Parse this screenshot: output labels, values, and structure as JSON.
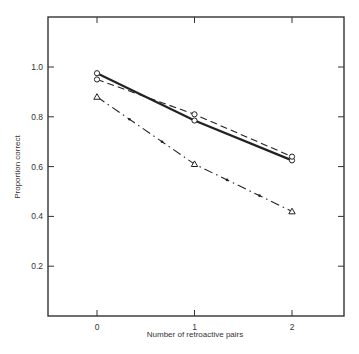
{
  "chart_data": {
    "type": "line",
    "title": "",
    "xlabel": "Number of retroactive pairs",
    "ylabel": "Proportion correct",
    "x": [
      0,
      1,
      2
    ],
    "xticks": [
      "0",
      "1",
      "2"
    ],
    "yticks": [
      "0.2",
      "0.4",
      "0.6",
      "0.8",
      "1.0"
    ],
    "xlim": [
      -0.5,
      2.5
    ],
    "ylim": [
      0,
      1.2
    ],
    "grid": false,
    "legend": null,
    "series": [
      {
        "name": "solid line, open circles",
        "style": "solid",
        "marker": "circle",
        "values": [
          0.975,
          0.785,
          0.625
        ]
      },
      {
        "name": "dashed line, open circles",
        "style": "dashed",
        "marker": "circle",
        "values": [
          0.95,
          0.81,
          0.64
        ]
      },
      {
        "name": "dash-dot line, open triangles",
        "style": "dash-dot",
        "marker": "triangle",
        "values": [
          0.88,
          0.61,
          0.42
        ]
      }
    ]
  },
  "axes": {
    "xlabel": "Number of retroactive pairs",
    "ylabel": "Proportion correct",
    "xticks": [
      "0",
      "1",
      "2"
    ],
    "yticks": [
      "0.2",
      "0.4",
      "0.6",
      "0.8",
      "1.0"
    ]
  }
}
